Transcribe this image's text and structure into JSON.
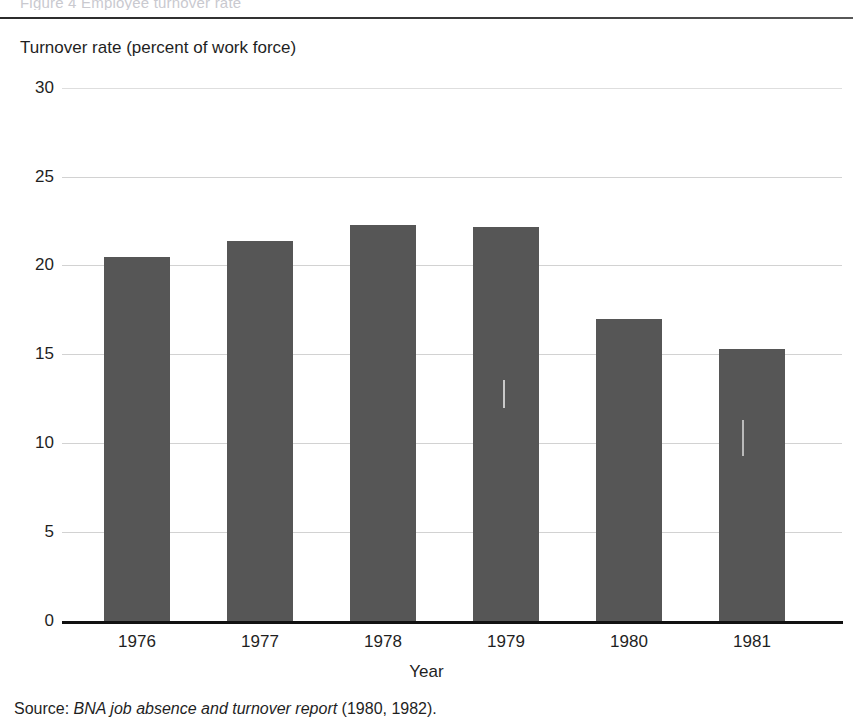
{
  "page": {
    "clipped_header_text": "Figure 4  Employee turnover rate",
    "source_prefix": "Source: ",
    "source_italic": "BNA job absence and turnover report",
    "source_suffix": " (1980, 1982)."
  },
  "chart_data": {
    "type": "bar",
    "title": "",
    "subtitle": "",
    "ylabel": "Turnover rate (percent of work force)",
    "xlabel": "Year",
    "categories": [
      "1976",
      "1977",
      "1978",
      "1979",
      "1980",
      "1981"
    ],
    "values": [
      20.5,
      21.4,
      22.3,
      22.2,
      17.0,
      15.3
    ],
    "series": [
      {
        "name": "Turnover rate",
        "values": [
          20.5,
          21.4,
          22.3,
          22.2,
          17.0,
          15.3
        ]
      }
    ],
    "ylim": [
      0,
      30
    ],
    "yticks": [
      0,
      5,
      10,
      15,
      20,
      25,
      30
    ],
    "ytick_labels": [
      "0",
      "5",
      "10",
      "15",
      "20",
      "25",
      "30"
    ],
    "grid": true,
    "grid_axis": "y",
    "legend": false,
    "legend_position": "none",
    "bar_color": "#565656",
    "gridline_color": "#d2d2d2",
    "axis_color": "#111111",
    "annotations": []
  }
}
